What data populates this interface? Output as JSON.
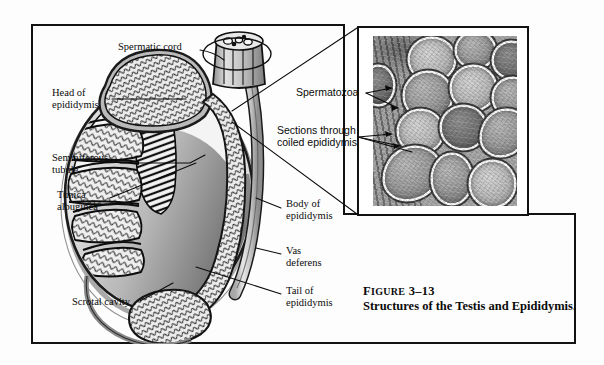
{
  "figure": {
    "caption_label": "FIGURE",
    "caption_number": "3–13",
    "caption_title": "Structures of the Testis and Epididymis."
  },
  "diagram": {
    "title": "Structures of the Testis and Epididymis",
    "labels": [
      {
        "id": "spermatic-cord",
        "text": "Spermatic cord",
        "side": "top",
        "x": 118,
        "y": 46
      },
      {
        "id": "head-of-epididymis",
        "text": "Head of\nepididymis",
        "side": "left",
        "x": 52,
        "y": 92
      },
      {
        "id": "seminiferous-tubule",
        "text": "Seminiferous\ntubule",
        "side": "left",
        "x": 52,
        "y": 157
      },
      {
        "id": "tunica-albuginea",
        "text": "Tunica\nalbuginea",
        "side": "left",
        "x": 57,
        "y": 194
      },
      {
        "id": "scrotal-cavity",
        "text": "Scrotal cavity",
        "side": "bottom-left",
        "x": 72,
        "y": 303
      },
      {
        "id": "body-of-epididymis",
        "text": "Body of\nepididymis",
        "side": "right",
        "x": 286,
        "y": 203
      },
      {
        "id": "vas-deferens",
        "text": "Vas\ndeferens",
        "side": "right",
        "x": 286,
        "y": 250
      },
      {
        "id": "tail-of-epididymis",
        "text": "Tail of\nepididymis",
        "side": "right",
        "x": 286,
        "y": 290
      }
    ]
  },
  "inset": {
    "labels": [
      {
        "id": "spermatozoa",
        "text": "Spermatozoa",
        "x": 298,
        "y": 90
      },
      {
        "id": "sections-through-coiled-epididymis",
        "text": "Sections through\ncoiled epididymis",
        "x": 280,
        "y": 128
      }
    ],
    "micrograph_alt": "Light micrograph of cross sections through the coiled epididymis showing spermatozoa in the lumens"
  },
  "colors": {
    "ink": "#0b0b0b",
    "frame": "#121212",
    "page": "#fdfdfd",
    "tissue_light": "#cfcfcf",
    "tissue_mid": "#9c9c9c",
    "tissue_dark": "#5c5c5c"
  }
}
